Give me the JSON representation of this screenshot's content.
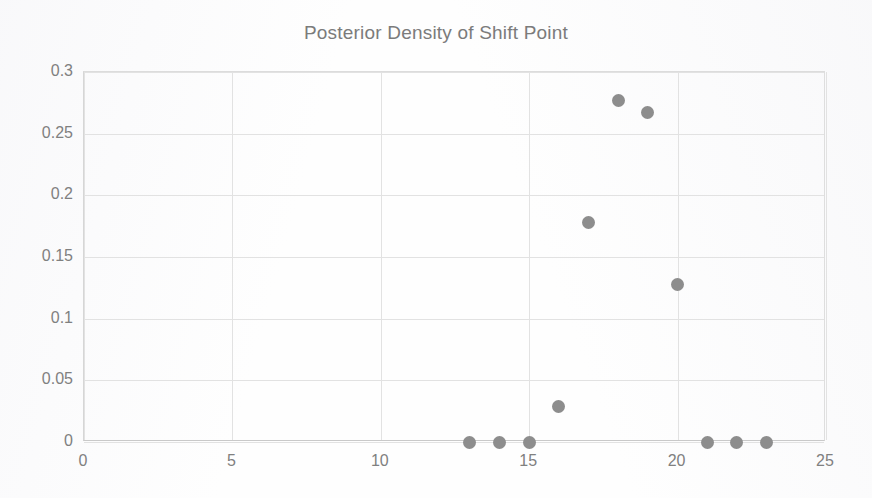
{
  "chart_data": {
    "type": "scatter",
    "title": "Posterior Density of Shift Point",
    "xlabel": "",
    "ylabel": "",
    "xlim": [
      0,
      25
    ],
    "ylim": [
      0,
      0.3
    ],
    "grid": true,
    "legend": "none",
    "marker_color": "#8d8d8d",
    "x": [
      13,
      14,
      15,
      16,
      17,
      18,
      19,
      20,
      21,
      22,
      23
    ],
    "y": [
      0,
      0,
      0,
      0.029,
      0.178,
      0.277,
      0.267,
      0.128,
      0,
      0,
      0
    ],
    "points": [
      {
        "x": 13,
        "y": 0
      },
      {
        "x": 14,
        "y": 0
      },
      {
        "x": 15,
        "y": 0
      },
      {
        "x": 16,
        "y": 0.029
      },
      {
        "x": 17,
        "y": 0.178
      },
      {
        "x": 18,
        "y": 0.277
      },
      {
        "x": 19,
        "y": 0.267
      },
      {
        "x": 20,
        "y": 0.128
      },
      {
        "x": 21,
        "y": 0
      },
      {
        "x": 22,
        "y": 0
      },
      {
        "x": 23,
        "y": 0
      }
    ],
    "xticks": [
      0,
      5,
      10,
      15,
      20,
      25
    ],
    "xtick_labels": [
      "0",
      "5",
      "10",
      "15",
      "20",
      "25"
    ],
    "yticks": [
      0,
      0.05,
      0.1,
      0.15,
      0.2,
      0.25,
      0.3
    ],
    "ytick_labels": [
      "0",
      "0.05",
      "0.1",
      "0.15",
      "0.2",
      "0.25",
      "0.3"
    ]
  }
}
